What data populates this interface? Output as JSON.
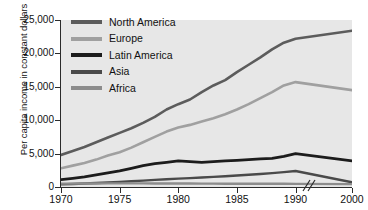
{
  "chart_data": {
    "type": "line",
    "title": "",
    "xlabel": "",
    "ylabel": "Per capita income in constant dollars",
    "x": [
      1970,
      1971,
      1972,
      1973,
      1974,
      1975,
      1976,
      1977,
      1978,
      1979,
      1980,
      1981,
      1982,
      1983,
      1984,
      1985,
      1986,
      1987,
      1988,
      1989,
      1990,
      2000
    ],
    "xlim": [
      1970,
      2000
    ],
    "ylim": [
      0,
      25000
    ],
    "grid": false,
    "axis_break": {
      "between": [
        1990,
        2000
      ],
      "label": "//"
    },
    "legend_position": "top-left",
    "xtick_labels": [
      "1970",
      "1975",
      "1980",
      "1985",
      "1990",
      "2000"
    ],
    "xtick_values": [
      1970,
      1975,
      1980,
      1985,
      1990,
      2000
    ],
    "ytick_labels": [
      "0",
      "5,000",
      "10,000",
      "15,000",
      "20,000",
      "25,000"
    ],
    "ytick_values": [
      0,
      5000,
      10000,
      15000,
      20000,
      25000
    ],
    "series": [
      {
        "name": "North America",
        "color": "#5c5c5c",
        "width": 2.6,
        "values": [
          4800,
          5400,
          6000,
          6700,
          7400,
          8100,
          8800,
          9600,
          10500,
          11600,
          12400,
          13100,
          14200,
          15200,
          16000,
          17200,
          18300,
          19400,
          20600,
          21600,
          22200,
          23400
        ]
      },
      {
        "name": "Europe",
        "color": "#a0a0a0",
        "width": 2.6,
        "values": [
          2800,
          3200,
          3600,
          4100,
          4700,
          5200,
          5900,
          6700,
          7500,
          8300,
          8900,
          9300,
          9800,
          10300,
          10900,
          11600,
          12400,
          13300,
          14200,
          15200,
          15700,
          14500
        ]
      },
      {
        "name": "Latin America",
        "color": "#1c1c1c",
        "width": 2.8,
        "values": [
          1100,
          1300,
          1500,
          1800,
          2100,
          2400,
          2800,
          3200,
          3500,
          3700,
          3900,
          3800,
          3700,
          3800,
          3900,
          4000,
          4100,
          4200,
          4300,
          4600,
          5000,
          3900
        ]
      },
      {
        "name": "Asia",
        "color": "#4a4a4a",
        "width": 2.4,
        "values": [
          400,
          450,
          520,
          600,
          680,
          760,
          860,
          960,
          1060,
          1160,
          1250,
          1330,
          1420,
          1520,
          1620,
          1720,
          1830,
          1950,
          2080,
          2230,
          2400,
          700
        ]
      },
      {
        "name": "Africa",
        "color": "#8c8c8c",
        "width": 2.4,
        "values": [
          500,
          510,
          520,
          530,
          540,
          550,
          545,
          540,
          535,
          530,
          525,
          515,
          505,
          500,
          495,
          490,
          485,
          480,
          478,
          476,
          475,
          430
        ]
      }
    ]
  },
  "legend": {
    "items": [
      {
        "label": "North America",
        "color": "#5c5c5c"
      },
      {
        "label": "Europe",
        "color": "#a0a0a0"
      },
      {
        "label": "Latin America",
        "color": "#1c1c1c"
      },
      {
        "label": "Asia",
        "color": "#4a4a4a"
      },
      {
        "label": "Africa",
        "color": "#8c8c8c"
      }
    ]
  },
  "axis": {
    "y_title": "Per capita income in constant dollars",
    "break_mark": "//"
  }
}
